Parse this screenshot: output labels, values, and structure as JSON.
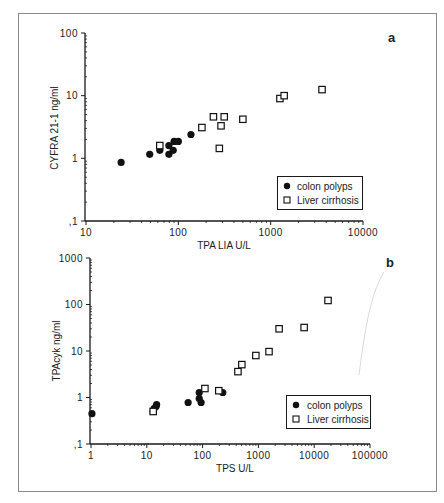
{
  "figure": {
    "frame_color": "#8a8a8a",
    "ink_color": "#1a1a1a"
  },
  "chart_data": [
    {
      "type": "scatter",
      "panel_label": "a",
      "title": "",
      "xlabel": "TPA LIA U/L",
      "ylabel": "CYFRA 21-1 ng/ml",
      "xscale": "log",
      "yscale": "log",
      "xlim": [
        10,
        10000
      ],
      "ylim": [
        0.1,
        100
      ],
      "x_tick_labels": [
        "10",
        "100",
        "1000",
        "10000"
      ],
      "y_tick_labels": [
        ",1",
        "1",
        "10",
        "100"
      ],
      "grid": false,
      "legend_position": "lower right",
      "series": [
        {
          "name": "colon polyps",
          "marker": "filled-circle",
          "x": [
            24,
            49,
            63,
            79,
            79,
            88,
            90,
            100,
            137
          ],
          "y": [
            0.86,
            1.16,
            1.34,
            1.16,
            1.6,
            1.34,
            1.86,
            1.86,
            2.4
          ]
        },
        {
          "name": "Liver cirrhosis",
          "marker": "open-square",
          "x": [
            63,
            180,
            240,
            314,
            290,
            278,
            500,
            1260,
            1400,
            3600
          ],
          "y": [
            1.6,
            3.1,
            4.6,
            4.6,
            3.3,
            1.44,
            4.2,
            9.0,
            10.0,
            12.5
          ]
        }
      ]
    },
    {
      "type": "scatter",
      "panel_label": "b",
      "title": "",
      "xlabel": "TPS U/L",
      "ylabel": "TPAcyk ng/ml",
      "xscale": "log",
      "yscale": "log",
      "xlim": [
        1,
        100000
      ],
      "ylim": [
        0.1,
        1000
      ],
      "x_tick_labels": [
        "1",
        "10",
        "100",
        "1000",
        "10000",
        "100000"
      ],
      "y_tick_labels": [
        ",1",
        "1",
        "10",
        "100",
        "1000"
      ],
      "grid": false,
      "legend_position": "lower right",
      "series": [
        {
          "name": "colon polyps",
          "marker": "filled-circle",
          "x": [
            1.04,
            13,
            13.5,
            14.6,
            15,
            55,
            87,
            87,
            94,
            230
          ],
          "y": [
            0.45,
            0.5,
            0.58,
            0.64,
            0.7,
            0.78,
            1.28,
            0.95,
            0.78,
            1.28
          ]
        },
        {
          "name": "Liver cirrhosis",
          "marker": "open-square",
          "x": [
            13,
            110,
            195,
            430,
            505,
            900,
            1550,
            2350,
            6600,
            17700
          ],
          "y": [
            0.5,
            1.56,
            1.4,
            3.6,
            5.1,
            8.0,
            9.7,
            30,
            32,
            122
          ]
        }
      ]
    }
  ]
}
